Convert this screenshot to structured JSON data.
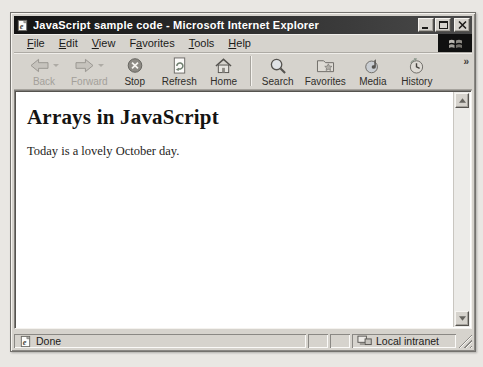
{
  "titlebar": {
    "title": "JavaScript sample code - Microsoft Internet Explorer",
    "icon": "ie-page-icon"
  },
  "window_controls": {
    "minimize_icon": "minimize-icon",
    "maximize_icon": "maximize-icon",
    "close_icon": "close-icon"
  },
  "menubar": {
    "items": [
      {
        "label": "File",
        "accel": 0
      },
      {
        "label": "Edit",
        "accel": 0
      },
      {
        "label": "View",
        "accel": 0
      },
      {
        "label": "Favorites",
        "accel": 1
      },
      {
        "label": "Tools",
        "accel": 0
      },
      {
        "label": "Help",
        "accel": 0
      }
    ],
    "brand_icon": "windows-logo-icon"
  },
  "toolbar": {
    "buttons": [
      {
        "label": "Back",
        "icon": "back-arrow-icon",
        "disabled": true,
        "dropdown": true
      },
      {
        "label": "Forward",
        "icon": "forward-arrow-icon",
        "disabled": true,
        "dropdown": true
      },
      {
        "label": "Stop",
        "icon": "stop-icon"
      },
      {
        "label": "Refresh",
        "icon": "refresh-icon"
      },
      {
        "label": "Home",
        "icon": "home-icon"
      },
      {
        "separator": true
      },
      {
        "label": "Search",
        "icon": "search-icon"
      },
      {
        "label": "Favorites",
        "icon": "favorites-icon"
      },
      {
        "label": "Media",
        "icon": "media-icon"
      },
      {
        "label": "History",
        "icon": "history-icon"
      }
    ],
    "overflow_chevron": "»"
  },
  "content": {
    "heading": "Arrays in JavaScript",
    "paragraph": "Today is a lovely October day."
  },
  "statusbar": {
    "status": "Done",
    "status_icon": "ie-page-icon",
    "zone_label": "Local intranet",
    "zone_icon": "intranet-icon"
  },
  "colors": {
    "titlebar_bg": "#141414",
    "chrome_bg": "#d6d3cd",
    "content_bg": "#ffffff",
    "disabled_text": "#a3a09a",
    "text": "#1c1b19"
  }
}
